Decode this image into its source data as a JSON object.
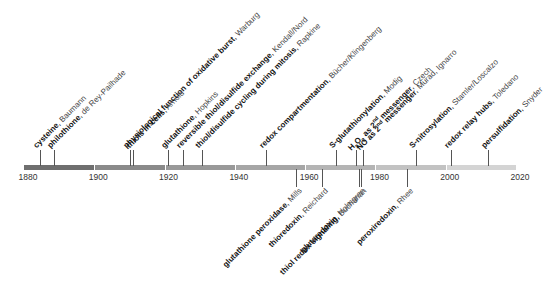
{
  "axis": {
    "start_year": 1880,
    "end_year": 2020,
    "x_start": 24,
    "x_end": 516,
    "year_labels": [
      "1880",
      "1900",
      "1920",
      "1940",
      "1960",
      "1980",
      "2000",
      "2020"
    ],
    "segment_colors": [
      "#6f6f6f",
      "#8a8a8a",
      "#999999",
      "#a6a6a6",
      "#b4b4b4",
      "#c2c2c2",
      "#d4d4d4"
    ]
  },
  "events_above": [
    {
      "year": 1884,
      "x": 40,
      "topic": "cysteine",
      "author": "Baumann"
    },
    {
      "year": 1888,
      "x": 54,
      "topic": "philothione",
      "author": "de Rey-Pailhade"
    },
    {
      "year": 1908,
      "x": 130,
      "topic": "physiological function of oxidative burst",
      "author": "Warburg"
    },
    {
      "year": 1910,
      "x": 133,
      "topic": "thiols in cells",
      "author": "Arnold"
    },
    {
      "year": 1921,
      "x": 168,
      "topic": "glutathione",
      "author": "Hopkins"
    },
    {
      "year": 1925,
      "x": 183,
      "topic": "reversible thiol/disulfide exchange",
      "author": "Kendall/Nord"
    },
    {
      "year": 1931,
      "x": 202,
      "topic": "thiol/disulfide cycling during mitosis",
      "author": "Rapkine"
    },
    {
      "year": 1950,
      "x": 266,
      "topic": "redox compartmentation",
      "author": "Bücher/Klingenberg"
    },
    {
      "year": 1969,
      "x": 336,
      "topic": "S-glutathionylation",
      "author": "Modig"
    },
    {
      "year": 1975,
      "x": 356,
      "topic": "H2O2 as 2nd messenger",
      "topic_html": "H<sub>2</sub>O<sub>2</sub> as 2<sup>nd</sup> messenger",
      "author": "Czech"
    },
    {
      "year": 1977,
      "x": 363,
      "topic": "NO as 2nd messenger",
      "topic_html": "NO as 2<sup>nd</sup> messenger",
      "author": "Murad, Ignarro"
    },
    {
      "year": 1992,
      "x": 416,
      "topic": "S-nitrosylation",
      "author": "Stamler/Loscalzo"
    },
    {
      "year": 2001,
      "x": 451,
      "topic": "redox relay hubs",
      "author": "Toledano"
    },
    {
      "year": 2012,
      "x": 488,
      "topic": "persulfidation",
      "author": "Snyder"
    }
  ],
  "events_below": [
    {
      "year": 1957,
      "x": 296,
      "topic": "glutathione peroxidase",
      "author": "Mills"
    },
    {
      "year": 1964,
      "x": 322,
      "topic": "thioredoxin",
      "author": "Reichard"
    },
    {
      "year": 1976,
      "x": 359,
      "topic": "glutaredoxin",
      "author": "Holmgren"
    },
    {
      "year": 1977,
      "x": 361,
      "topic": "thiol redox signaling",
      "author": "Buchanan"
    },
    {
      "year": 1989,
      "x": 407,
      "topic": "peroxiredoxin",
      "author": "Rhee"
    }
  ]
}
